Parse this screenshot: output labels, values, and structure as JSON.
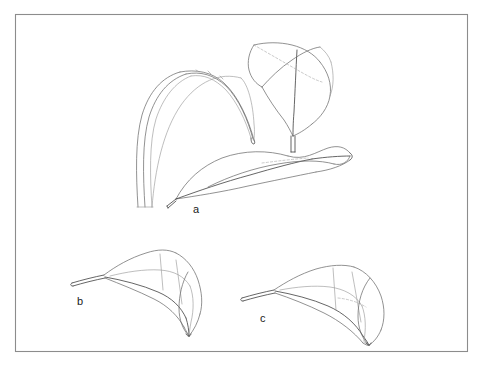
{
  "figure": {
    "caption_labels": [
      {
        "id": "a",
        "text": "a",
        "x": 193,
        "y": 204
      },
      {
        "id": "b",
        "text": "b",
        "x": 77,
        "y": 296
      },
      {
        "id": "c",
        "text": "c",
        "x": 260,
        "y": 313
      }
    ],
    "frame": {
      "x": 15,
      "y": 14,
      "width": 453,
      "height": 338,
      "stroke_color": "#8c8c8c"
    },
    "background_color": "#ffffff",
    "line_color": "#6e6e6e",
    "line_color_dark": "#4a4a4a",
    "line_color_light": "#9a9a9a",
    "hidden_line_color": "#a6a6a6",
    "panels": [
      {
        "id": "arching-blade",
        "name": "long arching grass blade",
        "label": "",
        "description": "tall narrow blade arching from lower left up over the top and down to a pointed tip at right"
      },
      {
        "id": "folded-leaf-top-right",
        "name": "folded leaf with vertical petiole",
        "label": "",
        "description": "broad leaf folded and twisted, petiole descending vertically at bottom"
      },
      {
        "id": "twisted-leaf-a",
        "name": "elongated twisted leaf",
        "label": "a",
        "description": "long narrow leaf twisted along its midrib, tip at right, petiole at lower left"
      },
      {
        "id": "curled-leaf-b",
        "name": "curled leaf b",
        "label": "b",
        "description": "leaf with petiole at left, blade curving and curling down to a tip at lower right"
      },
      {
        "id": "curled-leaf-c",
        "name": "curled leaf c",
        "label": "c",
        "description": "leaf with petiole at left, blade broader, curling down to a tip at lower right"
      }
    ]
  }
}
